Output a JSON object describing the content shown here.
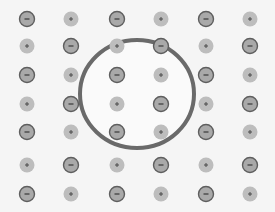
{
  "diagram": {
    "title": "",
    "background": "#f5f5f5",
    "grid": {
      "columns_x": [
        27,
        71,
        117,
        161,
        206,
        250
      ],
      "rows_y": [
        19,
        46,
        75,
        104,
        132,
        165,
        194
      ],
      "ions": [
        [
          "-",
          "+",
          "-",
          "+",
          "-",
          "+"
        ],
        [
          "+",
          "-",
          "+",
          "-",
          "+",
          "-"
        ],
        [
          "-",
          "+",
          "-",
          "+",
          "-",
          "+"
        ],
        [
          "+",
          "-",
          "+",
          "-",
          "+",
          "-"
        ],
        [
          "-",
          "+",
          "-",
          "+",
          "-",
          "+"
        ],
        [
          "+",
          "-",
          "+",
          "-",
          "+",
          "-"
        ],
        [
          "-",
          "+",
          "-",
          "+",
          "-",
          "+"
        ]
      ]
    },
    "ion_styles": {
      "negative": {
        "symbol": "−",
        "fill": "#a9a9a9",
        "stroke": "#5e5e5e",
        "radius": 7.5,
        "symbol_color": "#3a3a3a"
      },
      "positive": {
        "symbol": "+",
        "fill": "#bdbdbd",
        "stroke": "none",
        "radius": 7.5,
        "symbol_color": "#4a4a4a"
      }
    },
    "highlight_circle": {
      "cx": 137,
      "cy": 94,
      "rx": 57,
      "ry": 54,
      "stroke": "#6a6a6a",
      "stroke_width": 4,
      "fill": "#fafafa"
    }
  }
}
